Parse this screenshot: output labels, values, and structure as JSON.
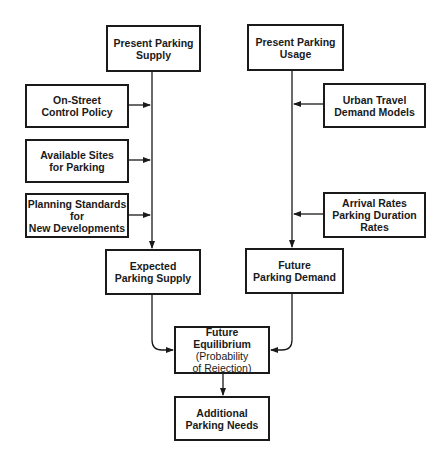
{
  "diagram": {
    "type": "flowchart",
    "nodes": {
      "present_supply": {
        "lines": [
          "Present Parking",
          "Supply"
        ]
      },
      "present_usage": {
        "lines": [
          "Present Parking",
          "Usage"
        ]
      },
      "on_street": {
        "lines": [
          "On-Street",
          "Control Policy"
        ]
      },
      "available_sites": {
        "lines": [
          "Available Sites",
          "for Parking"
        ]
      },
      "planning_standards": {
        "lines": [
          "Planning Standards",
          "for",
          "New Developments"
        ]
      },
      "urban_travel": {
        "lines": [
          "Urban Travel",
          "Demand Models"
        ]
      },
      "arrival_rates": {
        "lines": [
          "Arrival Rates",
          "Parking Duration",
          "Rates"
        ]
      },
      "expected_supply": {
        "lines": [
          "Expected",
          "Parking Supply"
        ]
      },
      "future_demand": {
        "lines": [
          "Future",
          "Parking Demand"
        ]
      },
      "future_equilibrium": {
        "lines": [
          "Future Equilibrium",
          "(Probability",
          "of Rejection)"
        ]
      },
      "additional_needs": {
        "lines": [
          "Additional",
          "Parking Needs"
        ]
      }
    },
    "edges": [
      {
        "from": "present_supply",
        "to": "expected_supply"
      },
      {
        "from": "on_street",
        "to": "supply_line"
      },
      {
        "from": "available_sites",
        "to": "supply_line"
      },
      {
        "from": "planning_standards",
        "to": "supply_line"
      },
      {
        "from": "present_usage",
        "to": "future_demand"
      },
      {
        "from": "urban_travel",
        "to": "usage_line"
      },
      {
        "from": "arrival_rates",
        "to": "usage_line"
      },
      {
        "from": "expected_supply",
        "to": "future_equilibrium"
      },
      {
        "from": "future_demand",
        "to": "future_equilibrium"
      },
      {
        "from": "future_equilibrium",
        "to": "additional_needs"
      }
    ],
    "colors": {
      "line": "#1a1a1a",
      "background": "#ffffff"
    }
  }
}
